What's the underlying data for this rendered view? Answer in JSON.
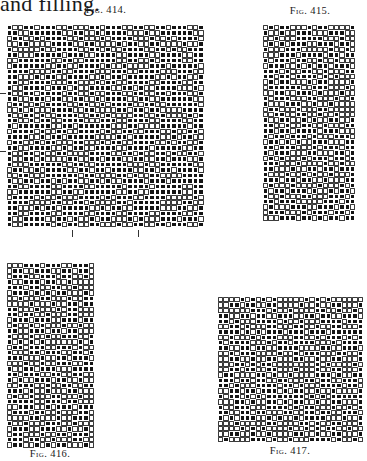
{
  "page": {
    "top_text": "and filling."
  },
  "figures": [
    {
      "id": "fig414",
      "caption": "Fig. 414.",
      "caption_pos": {
        "x": 106,
        "y": 4
      },
      "grid": {
        "x": 7,
        "y": 25,
        "cols": 36,
        "rows": 37,
        "cell": 5.47
      },
      "pattern": "twill-broken",
      "seed": 414,
      "marks": {
        "bottom_ticks_x": [
          72,
          138
        ],
        "bottom_ticks_y": [
          230,
          237
        ],
        "left_ticks_y": [
          93,
          151
        ],
        "left_ticks_x": [
          0,
          6
        ]
      }
    },
    {
      "id": "fig415",
      "caption": "Fig. 415.",
      "caption_pos": {
        "x": 310,
        "y": 5
      },
      "grid": {
        "x": 263,
        "y": 25,
        "cols": 17,
        "rows": 36,
        "cell": 5.45
      },
      "pattern": "diamond",
      "seed": 415
    },
    {
      "id": "fig416",
      "caption": "Fig. 416.",
      "caption_pos": {
        "x": 50,
        "y": 448
      },
      "grid": {
        "x": 7,
        "y": 263,
        "cols": 16,
        "rows": 34,
        "cell": 5.45
      },
      "pattern": "zigzag",
      "seed": 416
    },
    {
      "id": "fig417",
      "caption": "Fig. 417.",
      "caption_pos": {
        "x": 290,
        "y": 445
      },
      "grid": {
        "x": 218,
        "y": 297,
        "cols": 27,
        "rows": 27,
        "cell": 5.38
      },
      "pattern": "diamond-twill",
      "seed": 417
    }
  ],
  "legend": {
    "filled_cell": "warp up (black square)",
    "open_cell": "weft up (white square)"
  }
}
